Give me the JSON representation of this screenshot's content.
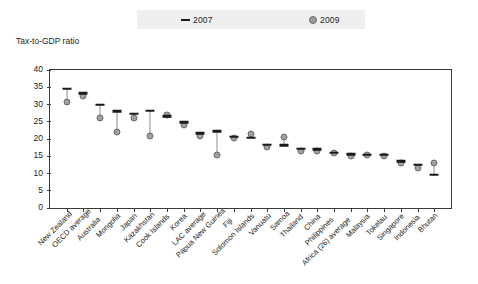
{
  "chart_data": {
    "type": "scatter",
    "title": "",
    "ylabel": "Tax-to-GDP ratio",
    "xlabel": "",
    "ylim": [
      0,
      40
    ],
    "yticks": [
      0,
      5,
      10,
      15,
      20,
      25,
      30,
      35,
      40
    ],
    "grid": false,
    "legend_position": "top",
    "legend": [
      {
        "name": "2007",
        "marker": "dash",
        "color": "#1a1a1a"
      },
      {
        "name": "2009",
        "marker": "circle",
        "color": "#a0a0a0"
      }
    ],
    "categories": [
      "New Zealand",
      "OECD average",
      "Australia",
      "Mongolia",
      "Japan",
      "Kazakhstan",
      "Cook Islands",
      "Korea",
      "LAC average",
      "Papua New Guinea",
      "Fiji",
      "Solomon Islands",
      "Vanuatu",
      "Samoa",
      "Thailand",
      "China",
      "Philippines",
      "Africa (26) average",
      "Malaysia",
      "Tokelau",
      "Singapore",
      "Indonesia",
      "Bhutan"
    ],
    "series": [
      {
        "name": "2007",
        "values": [
          34.5,
          33.2,
          30.0,
          28.0,
          27.3,
          28.2,
          26.6,
          24.8,
          21.6,
          22.2,
          20.6,
          20.4,
          18.3,
          18.2,
          17.2,
          17.1,
          16.0,
          15.6,
          15.5,
          15.4,
          13.6,
          12.6,
          9.6
        ]
      },
      {
        "name": "2009",
        "values": [
          30.6,
          32.6,
          26.0,
          22.0,
          26.2,
          21.0,
          27.1,
          24.2,
          21.0,
          15.5,
          20.4,
          21.5,
          17.6,
          20.5,
          16.6,
          16.5,
          15.8,
          15.0,
          15.4,
          15.0,
          13.0,
          11.5,
          13.0
        ]
      }
    ]
  }
}
